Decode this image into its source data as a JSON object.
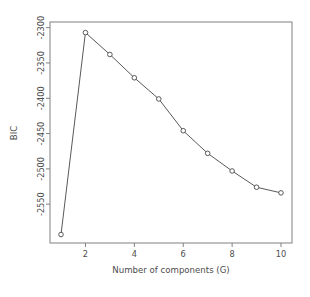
{
  "chart_data": {
    "type": "line",
    "title": "",
    "subtitle": "",
    "xlabel": "Number of components (G)",
    "ylabel": "BIC",
    "x": [
      1,
      2,
      3,
      4,
      5,
      6,
      7,
      8,
      9,
      10
    ],
    "values": [
      -2593,
      -2307,
      -2338,
      -2371,
      -2401,
      -2446,
      -2478,
      -2503,
      -2526,
      -2534
    ],
    "series": [
      {
        "name": "BIC",
        "values": [
          -2593,
          -2307,
          -2338,
          -2371,
          -2401,
          -2446,
          -2478,
          -2503,
          -2526,
          -2534
        ]
      }
    ],
    "xlim": [
      0.55,
      10.45
    ],
    "ylim": [
      -2605,
      -2292
    ],
    "xticks": [
      2,
      4,
      6,
      8,
      10
    ],
    "xtick_labels": [
      "2",
      "4",
      "6",
      "8",
      "10"
    ],
    "yticks": [
      -2300,
      -2350,
      -2400,
      -2450,
      -2500,
      -2550
    ],
    "ytick_labels": [
      "-2300",
      "-2350",
      "-2400",
      "-2450",
      "-2500",
      "-2550"
    ],
    "grid": false,
    "legend": false,
    "legend_position": "none",
    "marker": "circle",
    "line_color": "#595959",
    "marker_color": "#595959",
    "axis_color": "#808080",
    "text_color": "#4d4d4d",
    "background": "#ffffff"
  }
}
